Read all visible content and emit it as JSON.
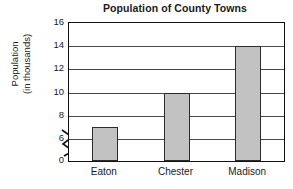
{
  "chart_data": {
    "type": "bar",
    "title": "Population of County Towns",
    "xlabel": "",
    "ylabel": "Population (in thousands)",
    "ylabel_lines": [
      "Population",
      "(in thousands)"
    ],
    "categories": [
      "Eaton",
      "Chester",
      "Madison"
    ],
    "values": [
      7,
      10,
      14
    ],
    "series": [
      {
        "name": "Population",
        "values": [
          7,
          10,
          14
        ]
      }
    ],
    "ylim": [
      0,
      16
    ],
    "yticks": [
      0,
      6,
      8,
      10,
      12,
      14,
      16
    ],
    "ytick_labels": [
      "0",
      "6",
      "8",
      "10",
      "12",
      "14",
      "16"
    ],
    "y_axis_break": true,
    "y_axis_break_between": [
      0,
      6
    ],
    "grid": "horizontal",
    "legend": "none",
    "bar_fill_color": "#c2c2c2",
    "bar_edge_color": "#2b2b2b",
    "grid_color": "#4a4a4a",
    "frame_color": "#111111",
    "background_color": "#ffffff"
  }
}
